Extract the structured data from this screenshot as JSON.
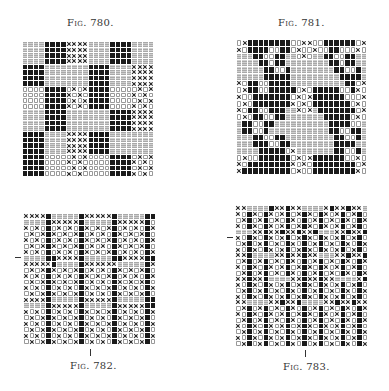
{
  "figures": [
    {
      "id": "fig-780",
      "caption": "Fig. 780.",
      "legend_codes": {
        "B": "solid black square",
        "G": "gray hatched square",
        "X": "cross",
        "O": "open circle"
      },
      "grid_rows": [
        "GGGGBBBBXXXXGGGGBBBBGGGG",
        "GGGGBBBBXXXXGGGGBBBBGGGG",
        "GGGGBBBBXXXXGGGGBBBBGGGG",
        "GGGGBBBBXXXXGGGGBBBBGGGG",
        "BBBBGGGGGGGGBBBBGGGGXXXX",
        "BBBBGGGGGGGGBBBBGGGGXXXX",
        "BBBBGGGGGGGGBBBBGGGGXXXX",
        "BBBBGGGGGGGGBBBBGGGGXXXX",
        "OOOOBBBBOXOXBBBBOOOOOXOX",
        "OOOOBBBBXOXOBBBBOOOOXOXO",
        "OOOOBBBBOXOXBBBBOOOOOXOX",
        "OOOOBBBBXOXOBBBBOOOOXOXO",
        "GGGGBBBBGGGGGGGGBBBBXXXX",
        "GGGGBBBBGGGGGGGGBBBBXXXX",
        "GGGGBBBBGGGGGGGGBBBBXXXX",
        "GGGGBBBBGGGGGGGGBBBBXXXX",
        "BBBBGGGGXXXXBBBBGGGGGGGG",
        "BBBBGGGGXXXXBBBBGGGGGGGG",
        "BBBBGGGGXXXXBBBBGGGGGGGG",
        "BBBBGGGGXXXXBBBBGGGGGGGG",
        "BBBBOOOOOXOXOOOOBBBBOXOX",
        "BBBBOOOOXOXOOOOOBBBBXOXO",
        "BBBBOOOOOXOXOOOOBBBBOXOX",
        "BBBBOOOOXOXOOOOOBBBBXOXO"
      ]
    },
    {
      "id": "fig-781",
      "caption": "Fig. 781.",
      "grid_rows": [
        "OXBBBBBBBBOOXXOOBBBBBBOX",
        "XOBBBBOOBBOXOOXOOBBOOOXO",
        "GGGBBOOBBGGOXOGGBBOOBBGG",
        "GGGGBBOBBGGGGGGGGBBOBBGG",
        "GGGGGBBOOBGGGGGGGGBBOOBG",
        "GGGGGBBBBBGGGGGGGGGBBBBG",
        "XOBBOOBBBBGGGGGGGGGGBBOX",
        "OXBBOOBBBBBOXOBBBBBOOBXO",
        "XOOBBBBBBBOXOXBBBBBBOOOX",
        "OXOBBBBBBBXOXOBBBBBBBOXO",
        "XOBBOOBBBGGXOXGBBBBBBBOX",
        "OXOBBOOBBGGGGGGGBBBBBOXO",
        "GBBOOBBGGGGGGGGGGBBBBOOG",
        "GBBOOBGGGGGGGGGGGBBOOBBG",
        "GGGBBOOBBGGGGGGGGGBBOOBG",
        "GGGBBBOOBBGGGGGGGGBBBBGG",
        "GGGGBBBBBOXGGGGGGGBBOOBG",
        "OXOOBBBBBBOXOXBBBBBBOOXO",
        "XOBBBBBBBBXOXOBBBBBBBBOX",
        "XBBBBBBBBBOXOOBBBBBBBBXO"
      ]
    },
    {
      "id": "fig-782",
      "caption": "Fig. 782.",
      "grid_rows": [
        "XXXXBGGGGGBXXXXXBGGGGGBB",
        "GGGGBXXXXXBGGGGGBXXXXXBO",
        "XOXOBOXOXOBXOXOXBOXOXOBX",
        "OXOXBXOXOXBOXOXOBXOXOXBO",
        "XOXOBOXOXOBXOXOXBOXOXOBX",
        "OXOXBXOXOXBOXOXOBXOXOXBO",
        "XOXOBOXOXOBXOXOXBOXOXOBX",
        "GGGGBBXXXXBGGGGGBBXXXXBB",
        "XXXXXBGGGGBXXXXXXGGGGGBX",
        "OXOXBXOXOXBOXOXOBXOXOXBO",
        "XOXOBOXOXOBXOXOXBOXOXOBX",
        "OXOXBXOXOXBOXOXOBXOXOXBO",
        "XOXOBOXOXOBXOXOXBOXOXOBX",
        "OXOXBXOXOXBOXOXOBXOXOXBO",
        "XXXXBGGGGGBXXXXXBGGGGGBB",
        "GGGGBXXXXXBGGGGGBXXXXXBB",
        "XOXOBOXOXOBXOXOXBOXOXOBX",
        "OXOXBXOXOXBOXOXOBXOXOXBO",
        "XOXOBOXOXOBXOXOXBOXOXOBX",
        "OXOXBXOXOXBOXOXOBXOXOXBO",
        "XOXOBOXOXOBXOXOXBOXOXOBX",
        "OXOXBXOXOXBOXOXOBXOXOXBO"
      ]
    },
    {
      "id": "fig-783",
      "caption": "Fig. 783.",
      "grid_rows": [
        "XXGGGGBXXBXXGGGGXBXXBXXG",
        "XOBXOBXOXBOXBXOBXOXBOXBO",
        "OXBOXBOXOBXOBOXBOXOBXOBX",
        "XOBXOBXOXBOXBXOBXOXBOXBO",
        "GGGXXBXXBXXBXXBGGGXXBXXB",
        "XOBXOBXOXBOXBXOBXOXBOXBO",
        "OXBOXBOXOBXOBOXBOXOBXOBX",
        "XOBXOBXOXBOXBXOBXOXBOXBO",
        "XXBGGGGXXBXXBXXGGGXXBXXB",
        "OXBOXBOXOBXOBOXBOXOBXOBX",
        "XOBXOBXOXBOXBXOBXOXBOXBO",
        "OXBOXBOXOBXOBOXBOXOBXOBX",
        "XXBXXBGGGGXXBXXBXXGGGGXB",
        "XOBXOBXOXBOXBXOBXOXBOXBO",
        "OXBOXBOXOBXOBOXBOXOBXOBX",
        "XOBXOBXOXBOXBXOBXOXBOXBO",
        "XXGGGGXXBXXBGGGGXXBXXBXX",
        "OXBOXBOXOBXOBOXBOXOBXOBX",
        "XOBXOBXOXBOXBXOBXOXBOXBO",
        "OXBOXBOXOBXOBOXBOXOBXOBX",
        "XOBXOBXOXBOXBXOBXOXBOXBO",
        "OXBOXBOXOBXOBOXBOXOBXOBX",
        "XOBXOBXOXBOXBXOBXOXBOXBO",
        "OXBOXBOXOBXOBOXBOXOBXOBX"
      ]
    }
  ]
}
